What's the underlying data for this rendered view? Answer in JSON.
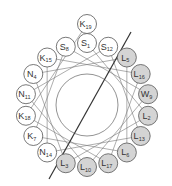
{
  "diagram": {
    "type": "helical-wheel",
    "center": [
      87,
      105
    ],
    "ring_radius": 62,
    "node_radius": 9.5,
    "inner_circle_radius": 31,
    "colors": {
      "hydrophobic_fill": "#d4d4d4",
      "polar_fill": "#ffffff",
      "stroke": "#555555",
      "connector": "#777777",
      "divider": "#333333"
    },
    "divider_line": {
      "x1": 131,
      "y1": 32,
      "x2": 49,
      "y2": 179
    },
    "residues": [
      {
        "aa": "S",
        "num": "1",
        "angle": 0,
        "ring": 0,
        "hydrophobic": false
      },
      {
        "aa": "L",
        "num": "2",
        "angle": 100,
        "ring": 0,
        "hydrophobic": true
      },
      {
        "aa": "L",
        "num": "3",
        "angle": 200,
        "ring": 0,
        "hydrophobic": true
      },
      {
        "aa": "N",
        "num": "4",
        "angle": 300,
        "ring": 0,
        "hydrophobic": false
      },
      {
        "aa": "L",
        "num": "5",
        "angle": 40,
        "ring": 0,
        "hydrophobic": true
      },
      {
        "aa": "L",
        "num": "6",
        "angle": 140,
        "ring": 0,
        "hydrophobic": true
      },
      {
        "aa": "K",
        "num": "7",
        "angle": 240,
        "ring": 0,
        "hydrophobic": false
      },
      {
        "aa": "S",
        "num": "8",
        "angle": 340,
        "ring": 0,
        "hydrophobic": false
      },
      {
        "aa": "W",
        "num": "9",
        "angle": 80,
        "ring": 0,
        "hydrophobic": true
      },
      {
        "aa": "L",
        "num": "10",
        "angle": 180,
        "ring": 0,
        "hydrophobic": true
      },
      {
        "aa": "N",
        "num": "11",
        "angle": 280,
        "ring": 0,
        "hydrophobic": false
      },
      {
        "aa": "S",
        "num": "12",
        "angle": 20,
        "ring": 0,
        "hydrophobic": false
      },
      {
        "aa": "L",
        "num": "13",
        "angle": 120,
        "ring": 0,
        "hydrophobic": true
      },
      {
        "aa": "N",
        "num": "14",
        "angle": 220,
        "ring": 0,
        "hydrophobic": false
      },
      {
        "aa": "K",
        "num": "15",
        "angle": 320,
        "ring": 0,
        "hydrophobic": false
      },
      {
        "aa": "L",
        "num": "16",
        "angle": 60,
        "ring": 0,
        "hydrophobic": true
      },
      {
        "aa": "L",
        "num": "17",
        "angle": 160,
        "ring": 0,
        "hydrophobic": true
      },
      {
        "aa": "K",
        "num": "18",
        "angle": 260,
        "ring": 0,
        "hydrophobic": false
      },
      {
        "aa": "K",
        "num": "19",
        "angle": 0,
        "ring": 1,
        "hydrophobic": false
      }
    ]
  }
}
